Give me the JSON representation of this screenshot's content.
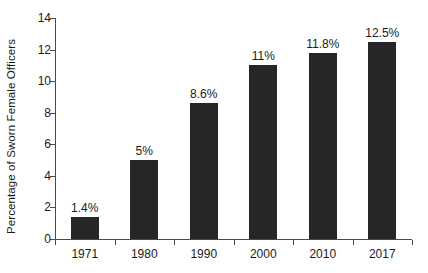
{
  "chart_data": {
    "type": "bar",
    "title": "",
    "subtitle": "",
    "xlabel": "",
    "ylabel": "Percentage of Sworn Female Officers",
    "categories": [
      "1971",
      "1980",
      "1990",
      "2000",
      "2010",
      "2017"
    ],
    "values": [
      1.4,
      5,
      8.6,
      11,
      11.8,
      12.5
    ],
    "value_labels": [
      "1.4%",
      "5%",
      "8.6%",
      "11%",
      "11.8%",
      "12.5%"
    ],
    "series": [
      {
        "name": "Percentage of Sworn Female Officers",
        "values": [
          1.4,
          5,
          8.6,
          11,
          11.8,
          12.5
        ]
      }
    ],
    "ylim": [
      0,
      14
    ],
    "xlim": [
      0,
      6
    ],
    "ytick_labels": [
      "0",
      "2",
      "4",
      "6",
      "8",
      "10",
      "12",
      "14"
    ],
    "ytick_values": [
      0,
      2,
      4,
      6,
      8,
      10,
      12,
      14
    ],
    "grid": false,
    "legend": false,
    "legend_position": "none",
    "bar_color": "#262626",
    "axis_color": "#4a4a4a",
    "background_color": "#ffffff",
    "annotations": []
  }
}
